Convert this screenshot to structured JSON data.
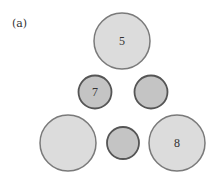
{
  "figure": {
    "label": "(a)",
    "circles": [
      {
        "id": "top",
        "cx": 122,
        "cy": 41,
        "r": 28,
        "fill": "#dcdcdc",
        "stroke": "#7a7a7a",
        "stroke_width": 1.5,
        "text": "5"
      },
      {
        "id": "mid-left",
        "cx": 95,
        "cy": 92,
        "r": 16.5,
        "fill": "#c4c4c4",
        "stroke": "#555555",
        "stroke_width": 1.8,
        "text": "7"
      },
      {
        "id": "mid-right",
        "cx": 151,
        "cy": 92,
        "r": 16.5,
        "fill": "#c4c4c4",
        "stroke": "#555555",
        "stroke_width": 1.8,
        "text": ""
      },
      {
        "id": "bottom-left",
        "cx": 68,
        "cy": 143,
        "r": 28,
        "fill": "#dcdcdc",
        "stroke": "#7a7a7a",
        "stroke_width": 1.5,
        "text": ""
      },
      {
        "id": "bottom-center",
        "cx": 123,
        "cy": 143,
        "r": 16,
        "fill": "#c4c4c4",
        "stroke": "#555555",
        "stroke_width": 1.8,
        "text": ""
      },
      {
        "id": "bottom-right",
        "cx": 177,
        "cy": 143,
        "r": 28,
        "fill": "#dcdcdc",
        "stroke": "#7a7a7a",
        "stroke_width": 1.5,
        "text": "8"
      }
    ]
  }
}
